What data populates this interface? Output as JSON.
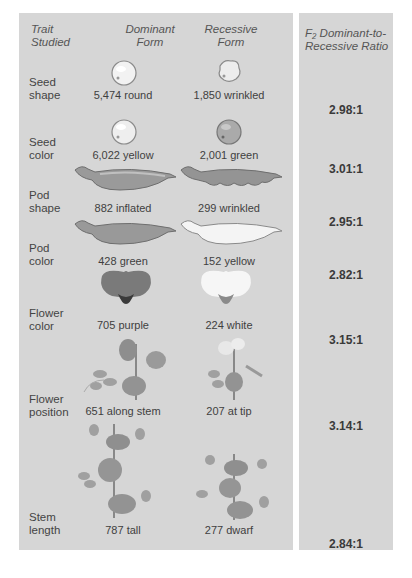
{
  "headers": {
    "trait": [
      "Trait",
      "Studied"
    ],
    "dominant": [
      "Dominant",
      "Form"
    ],
    "recessive": [
      "Recessive",
      "Form"
    ],
    "ratio": [
      "F₂ Dominant-to-",
      "Recessive Ratio"
    ]
  },
  "rows": [
    {
      "trait": [
        "Seed",
        "shape"
      ],
      "dominant": "5,474 round",
      "recessive": "1,850 wrinkled",
      "ratio": "2.98:1",
      "dom_icon": "round-seed-icon",
      "rec_icon": "wrinkled-seed-icon"
    },
    {
      "trait": [
        "Seed",
        "color"
      ],
      "dominant": "6,022 yellow",
      "recessive": "2,001 green",
      "ratio": "3.01:1",
      "dom_icon": "yellow-seed-icon",
      "rec_icon": "green-seed-icon"
    },
    {
      "trait": [
        "Pod",
        "shape"
      ],
      "dominant": "882 inflated",
      "recessive": "299 wrinkled",
      "ratio": "2.95:1",
      "dom_icon": "inflated-pod-icon",
      "rec_icon": "wrinkled-pod-icon"
    },
    {
      "trait": [
        "Pod",
        "color"
      ],
      "dominant": "428 green",
      "recessive": "152 yellow",
      "ratio": "2.82:1",
      "dom_icon": "green-pod-icon",
      "rec_icon": "yellow-pod-icon"
    },
    {
      "trait": [
        "Flower",
        "color"
      ],
      "dominant": "705 purple",
      "recessive": "224 white",
      "ratio": "3.15:1",
      "dom_icon": "purple-flower-icon",
      "rec_icon": "white-flower-icon"
    },
    {
      "trait": [
        "Flower",
        "position"
      ],
      "dominant": "651 along stem",
      "recessive": "207 at tip",
      "ratio": "3.14:1",
      "dom_icon": "axial-flower-plant-icon",
      "rec_icon": "terminal-flower-plant-icon"
    },
    {
      "trait": [
        "Stem",
        "length"
      ],
      "dominant": "787 tall",
      "recessive": "277 dwarf",
      "ratio": "2.84:1",
      "dom_icon": "tall-plant-icon",
      "rec_icon": "dwarf-plant-icon"
    }
  ]
}
